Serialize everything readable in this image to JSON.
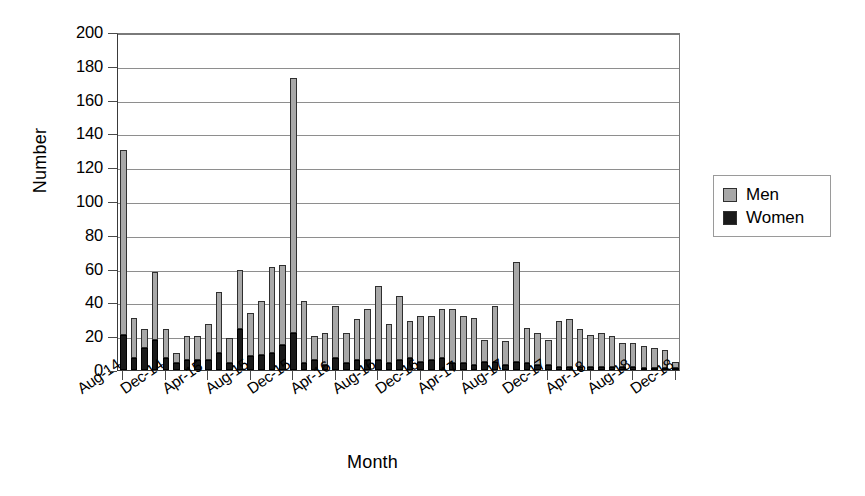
{
  "chart_data": {
    "type": "bar",
    "subtype": "stacked-column",
    "title": "",
    "xlabel": "Month",
    "ylabel": "Number",
    "ylim": [
      0,
      200
    ],
    "ytick_step": 20,
    "yticks": [
      0,
      20,
      40,
      60,
      80,
      100,
      120,
      140,
      160,
      180,
      200
    ],
    "grid": "horizontal",
    "legend_position": "right-outside",
    "legend": [
      "Men",
      "Women"
    ],
    "colors": {
      "men": "#a8a8a8",
      "women": "#1a1a1a",
      "axis": "#3a3a3a",
      "grid": "#8e8e8e"
    },
    "categories": [
      "Aug-14",
      "Sep-14",
      "Oct-14",
      "Nov-14",
      "Dec-14",
      "Jan-15",
      "Feb-15",
      "Mar-15",
      "Apr-15",
      "May-15",
      "Jun-15",
      "Jul-15",
      "Aug-15",
      "Sep-15",
      "Oct-15",
      "Nov-15",
      "Dec-15",
      "Jan-16",
      "Feb-16",
      "Mar-16",
      "Apr-16",
      "May-16",
      "Jun-16",
      "Jul-16",
      "Aug-16",
      "Sep-16",
      "Oct-16",
      "Nov-16",
      "Dec-16",
      "Jan-17",
      "Feb-17",
      "Mar-17",
      "Apr-17",
      "May-17",
      "Jun-17",
      "Jul-17",
      "Aug-17",
      "Sep-17",
      "Oct-17",
      "Nov-17",
      "Dec-17",
      "Jan-18",
      "Feb-18",
      "Mar-18",
      "Apr-18",
      "May-18",
      "Jun-18",
      "Jul-18",
      "Aug-18",
      "Sep-18",
      "Oct-18",
      "Nov-18",
      "Dec-18"
    ],
    "xtick_labels": [
      "Aug-14",
      "Dec-14",
      "Apr-15",
      "Aug-15",
      "Dec-15",
      "Apr-16",
      "Aug-16",
      "Dec-16",
      "Apr-17",
      "Aug-17",
      "Dec-17",
      "Apr-18",
      "Aug-18",
      "Dec-18"
    ],
    "xtick_indices": [
      0,
      4,
      8,
      12,
      16,
      20,
      24,
      28,
      32,
      36,
      40,
      44,
      48,
      52
    ],
    "series": [
      {
        "name": "Women",
        "values": [
          21,
          7,
          13,
          18,
          7,
          4,
          6,
          6,
          6,
          10,
          4,
          24,
          8,
          9,
          10,
          15,
          22,
          4,
          6,
          3,
          7,
          4,
          6,
          6,
          6,
          4,
          6,
          7,
          5,
          6,
          7,
          4,
          4,
          3,
          5,
          5,
          3,
          5,
          4,
          3,
          3,
          2,
          2,
          2,
          2,
          2,
          2,
          2,
          2,
          1,
          1,
          1,
          1
        ]
      },
      {
        "name": "Men",
        "values": [
          109,
          24,
          11,
          40,
          17,
          6,
          14,
          14,
          21,
          36,
          15,
          35,
          26,
          32,
          51,
          47,
          151,
          37,
          14,
          19,
          31,
          18,
          24,
          30,
          44,
          23,
          38,
          22,
          27,
          26,
          29,
          32,
          28,
          28,
          13,
          33,
          14,
          59,
          21,
          19,
          15,
          27,
          28,
          22,
          19,
          20,
          18,
          14,
          14,
          13,
          12,
          11,
          4
        ]
      }
    ],
    "totals": [
      130,
      31,
      24,
      58,
      24,
      10,
      20,
      20,
      27,
      46,
      19,
      59,
      34,
      41,
      61,
      62,
      173,
      41,
      20,
      22,
      38,
      22,
      30,
      36,
      50,
      27,
      44,
      29,
      32,
      32,
      36,
      36,
      32,
      31,
      18,
      38,
      17,
      64,
      25,
      22,
      18,
      29,
      30,
      24,
      21,
      22,
      20,
      16,
      16,
      14,
      13,
      12,
      5
    ],
    "notable_points": [
      {
        "category": "Aug-14",
        "total": 130
      },
      {
        "category": "Dec-15",
        "total": 173
      },
      {
        "category": "Jan-16",
        "total": 41
      },
      {
        "category": "Sep-17",
        "total": 64
      }
    ]
  }
}
